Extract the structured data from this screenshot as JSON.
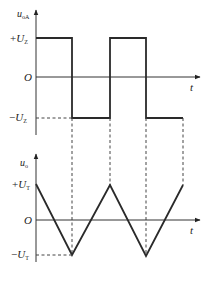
{
  "upper_plot": {
    "y_label": "u",
    "y_label_sub": "oA",
    "x_label": "t",
    "origin_label": "O",
    "pos_level": {
      "sign": "+",
      "symbol": "U",
      "sub": "Z"
    },
    "neg_level": {
      "sign": "−",
      "symbol": "U",
      "sub": "Z"
    },
    "waveform": "square"
  },
  "lower_plot": {
    "y_label": "u",
    "y_label_sub": "o",
    "x_label": "t",
    "origin_label": "O",
    "pos_level": {
      "sign": "+",
      "symbol": "U",
      "sub": "T"
    },
    "neg_level": {
      "sign": "−",
      "symbol": "U",
      "sub": "T"
    },
    "waveform": "triangle"
  },
  "colors": {
    "line": "#2a2a2a",
    "background": "#ffffff"
  }
}
